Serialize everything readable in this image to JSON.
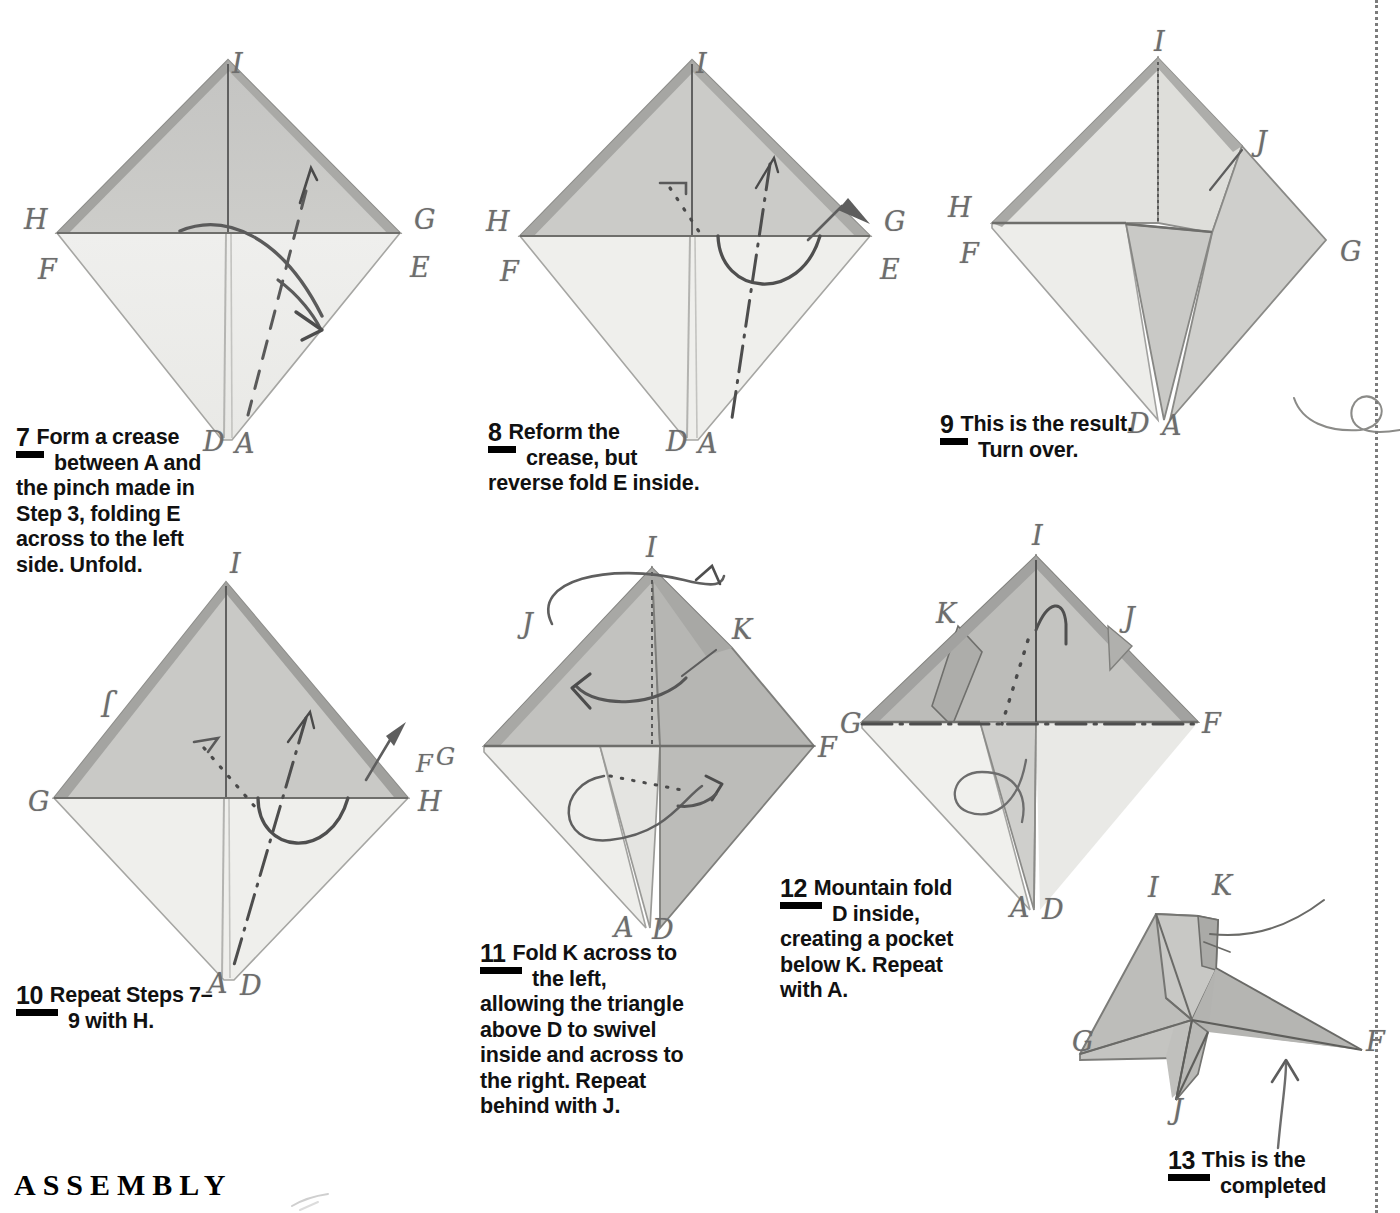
{
  "page": {
    "background_color": "#ffffff",
    "paper_light": "#f1f1ef",
    "paper_gray": "#c9c9c7",
    "pencil_line": "#6d6d6d",
    "ink_black": "#000000"
  },
  "section": {
    "heading": "ASSEMBLY"
  },
  "steps": [
    {
      "id": "step-7",
      "number": "7",
      "lines": [
        "Form a crease",
        "between A and",
        "the pinch made in",
        "Step 3, folding E",
        "across to the left",
        "side. Unfold."
      ]
    },
    {
      "id": "step-8",
      "number": "8",
      "lines": [
        "Reform the",
        "crease, but",
        "reverse fold E inside."
      ]
    },
    {
      "id": "step-9",
      "number": "9",
      "lines": [
        "This is the result.",
        "Turn over."
      ]
    },
    {
      "id": "step-10",
      "number": "10",
      "lines": [
        "Repeat Steps 7–",
        "9 with H."
      ]
    },
    {
      "id": "step-11",
      "number": "11",
      "lines": [
        "Fold K across to",
        "the left,",
        "allowing the triangle",
        "above D to swivel",
        "inside and across to",
        "the right. Repeat",
        "behind with J."
      ]
    },
    {
      "id": "step-12",
      "number": "12",
      "lines": [
        "Mountain fold",
        "D inside,",
        "creating a pocket",
        "below K. Repeat",
        "with A."
      ]
    },
    {
      "id": "step-13",
      "number": "13",
      "lines": [
        "This is the",
        "completed"
      ]
    }
  ],
  "diagrams": [
    {
      "id": "diagram-7",
      "caption_ref": "step-7",
      "shape": "diamond",
      "labels": [
        {
          "text": "I",
          "x": 222,
          "y": 22
        },
        {
          "text": "H",
          "x": 18,
          "y": 182
        },
        {
          "text": "F",
          "x": 33,
          "y": 232
        },
        {
          "text": "G",
          "x": 409,
          "y": 185
        },
        {
          "text": "E",
          "x": 405,
          "y": 230
        },
        {
          "text": "D",
          "x": 198,
          "y": 410
        },
        {
          "text": "A",
          "x": 228,
          "y": 410
        }
      ],
      "annotations": [
        "valley-fold-dashed-line",
        "curved-fold-arrow",
        "small-arrow-up"
      ]
    },
    {
      "id": "diagram-8",
      "caption_ref": "step-8",
      "shape": "diamond",
      "labels": [
        {
          "text": "I",
          "x": 225,
          "y": 22
        },
        {
          "text": "H",
          "x": 20,
          "y": 182
        },
        {
          "text": "F",
          "x": 33,
          "y": 232
        },
        {
          "text": "G",
          "x": 409,
          "y": 185
        },
        {
          "text": "E",
          "x": 404,
          "y": 230
        },
        {
          "text": "D",
          "x": 198,
          "y": 410
        },
        {
          "text": "A",
          "x": 228,
          "y": 410
        }
      ],
      "annotations": [
        "dash-dot-mountain-line",
        "dotted-hidden-edge",
        "reverse-fold-arc-arrow",
        "push-arrow"
      ]
    },
    {
      "id": "diagram-9",
      "caption_ref": "step-9",
      "shape": "diamond-folded",
      "labels": [
        {
          "text": "I",
          "x": 222,
          "y": 14
        },
        {
          "text": "J",
          "x": 327,
          "y": 125
        },
        {
          "text": "H",
          "x": 18,
          "y": 182
        },
        {
          "text": "F",
          "x": 30,
          "y": 228
        },
        {
          "text": "G",
          "x": 406,
          "y": 232
        },
        {
          "text": "D",
          "x": 200,
          "y": 404
        },
        {
          "text": "A",
          "x": 230,
          "y": 404
        }
      ],
      "annotations": [
        "edge-pointer-line"
      ]
    },
    {
      "id": "diagram-10",
      "caption_ref": "step-10",
      "shape": "diamond",
      "labels": [
        {
          "text": "J",
          "x": 85,
          "y": 158,
          "flip": true
        },
        {
          "text": "I",
          "x": 222,
          "y": 12
        },
        {
          "text": "G",
          "x": 12,
          "y": 262
        },
        {
          "text": "F",
          "x": 400,
          "y": 222
        },
        {
          "text": "G",
          "x": 424,
          "y": 214
        },
        {
          "text": "H",
          "x": 404,
          "y": 260
        },
        {
          "text": "A",
          "x": 198,
          "y": 432
        },
        {
          "text": "D",
          "x": 228,
          "y": 432
        }
      ],
      "annotations": [
        "dash-dot-mountain-line",
        "dotted-hidden-edge",
        "reverse-fold-arc-arrow",
        "push-arrow"
      ]
    },
    {
      "id": "diagram-11",
      "caption_ref": "step-11",
      "shape": "diamond-shaded",
      "labels": [
        {
          "text": "I",
          "x": 178,
          "y": 6
        },
        {
          "text": "J",
          "x": 57,
          "y": 90
        },
        {
          "text": "K",
          "x": 273,
          "y": 98
        },
        {
          "text": "G",
          "x": 383,
          "y": 203
        },
        {
          "text": "F",
          "x": 347,
          "y": 218
        },
        {
          "text": "A",
          "x": 148,
          "y": 393
        },
        {
          "text": "D",
          "x": 185,
          "y": 393
        }
      ],
      "annotations": [
        "rotation-arrow-over-top",
        "swivel-arrow-left",
        "dotted-hidden-edge",
        "swivel-arrow-lower"
      ]
    },
    {
      "id": "diagram-12",
      "caption_ref": "step-12",
      "shape": "diamond-shaded",
      "labels": [
        {
          "text": "I",
          "x": 197,
          "y": 6
        },
        {
          "text": "K",
          "x": 100,
          "y": 85
        },
        {
          "text": "J",
          "x": 290,
          "y": 90
        },
        {
          "text": "G",
          "x": 12,
          "y": 198
        },
        {
          "text": "F",
          "x": 363,
          "y": 198
        },
        {
          "text": "A",
          "x": 175,
          "y": 378
        },
        {
          "text": "D",
          "x": 205,
          "y": 378
        }
      ],
      "annotations": [
        "dotted-hidden-edge",
        "dash-dot-mountain-line",
        "mountain-fold-arrow",
        "loop-arrow"
      ]
    },
    {
      "id": "diagram-13",
      "caption_ref": "step-13",
      "shape": "completed-model",
      "labels": [
        {
          "text": "I",
          "x": 73,
          "y": 12
        },
        {
          "text": "K",
          "x": 137,
          "y": 10
        },
        {
          "text": "G",
          "x": 0,
          "y": 167
        },
        {
          "text": "F",
          "x": 285,
          "y": 168
        },
        {
          "text": "J",
          "x": 98,
          "y": 238
        }
      ],
      "annotations": [
        "pointer-line-to-pocket",
        "arrow-up-pointing-at-model"
      ]
    }
  ],
  "decorations": [
    {
      "name": "pencil-loop-squiggle"
    },
    {
      "name": "trim-dotted-line"
    }
  ]
}
